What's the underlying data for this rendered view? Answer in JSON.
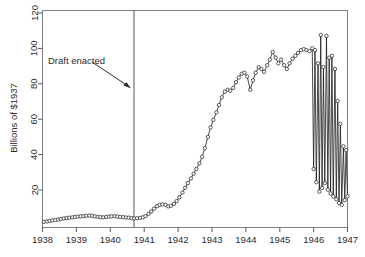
{
  "figure": {
    "background_color": "#ffffff",
    "frame_color": "#808080",
    "series_color": "#1a1a1a"
  },
  "axes": {
    "ylabel": "Billions of $1937",
    "y_ticks": [
      "20",
      "40",
      "60",
      "80",
      "100",
      "120"
    ],
    "x_ticks": [
      "1938",
      "1939",
      "1940",
      "1941",
      "1942",
      "1943",
      "1944",
      "1945",
      "1946",
      "1947"
    ]
  },
  "annotation": {
    "label": "Draft enacted",
    "event_year": 1940.7
  },
  "chart_data": {
    "type": "line",
    "title": "",
    "subtitle": "",
    "xlabel": "",
    "ylabel": "Billions of $1937",
    "xlim": [
      1938.0,
      1947.0
    ],
    "ylim": [
      10.0,
      125.0
    ],
    "grid": false,
    "legend": null,
    "marker": "open-circle",
    "x_tick_values": [
      1938,
      1939,
      1940,
      1941,
      1942,
      1943,
      1944,
      1945,
      1946,
      1947
    ],
    "y_tick_values": [
      20,
      40,
      60,
      80,
      100,
      120
    ],
    "annotations": [
      {
        "text": "Draft enacted",
        "x": 1940.7,
        "type": "vertical-line-with-arrow"
      }
    ],
    "series": [
      {
        "name": "Real military spending",
        "x": [
          1938.04,
          1938.13,
          1938.21,
          1938.29,
          1938.38,
          1938.46,
          1938.54,
          1938.63,
          1938.71,
          1938.79,
          1938.88,
          1938.96,
          1939.04,
          1939.13,
          1939.21,
          1939.29,
          1939.38,
          1939.46,
          1939.54,
          1939.63,
          1939.71,
          1939.79,
          1939.88,
          1939.96,
          1940.04,
          1940.13,
          1940.21,
          1940.29,
          1940.38,
          1940.46,
          1940.54,
          1940.63,
          1940.71,
          1940.79,
          1940.88,
          1940.96,
          1941.04,
          1941.13,
          1941.21,
          1941.29,
          1941.38,
          1941.46,
          1941.54,
          1941.63,
          1941.71,
          1941.79,
          1941.88,
          1941.96,
          1942.04,
          1942.13,
          1942.21,
          1942.29,
          1942.38,
          1942.46,
          1942.54,
          1942.63,
          1942.71,
          1942.79,
          1942.88,
          1942.96,
          1943.04,
          1943.13,
          1943.21,
          1943.29,
          1943.38,
          1943.46,
          1943.54,
          1943.63,
          1943.71,
          1943.79,
          1943.88,
          1943.96,
          1944.04,
          1944.13,
          1944.21,
          1944.29,
          1944.38,
          1944.46,
          1944.54,
          1944.63,
          1944.71,
          1944.79,
          1944.88,
          1944.96,
          1945.04,
          1945.13,
          1945.21,
          1945.29,
          1945.38,
          1945.46,
          1945.54,
          1945.63,
          1945.71,
          1945.79,
          1945.88,
          1945.96,
          1946.04,
          1946.13,
          1946.21,
          1946.29,
          1946.38,
          1946.46,
          1946.54,
          1946.63,
          1946.71,
          1946.79,
          1946.88,
          1946.96
        ],
        "values": [
          13.0,
          13.2,
          13.5,
          13.8,
          14.0,
          14.2,
          14.5,
          14.8,
          15.0,
          15.2,
          15.4,
          15.6,
          15.8,
          15.9,
          16.0,
          16.2,
          16.3,
          16.2,
          15.9,
          15.7,
          15.5,
          15.4,
          15.6,
          15.8,
          15.9,
          16.0,
          15.8,
          15.6,
          15.5,
          15.3,
          15.2,
          15.0,
          14.8,
          14.9,
          15.1,
          15.4,
          16.0,
          17.2,
          18.5,
          20.0,
          21.3,
          22.0,
          22.3,
          22.0,
          21.2,
          21.5,
          22.5,
          24.0,
          26.0,
          28.5,
          31.0,
          33.5,
          36.0,
          38.5,
          41.0,
          44.0,
          47.5,
          52.0,
          58.0,
          63.0,
          67.0,
          71.0,
          75.0,
          79.0,
          82.0,
          83.0,
          82.5,
          84.0,
          87.0,
          89.5,
          91.5,
          92.0,
          90.0,
          83.0,
          88.0,
          92.0,
          95.0,
          94.0,
          92.5,
          96.0,
          99.0,
          103.0,
          100.0,
          97.0,
          99.0,
          96.0,
          94.0,
          97.0,
          99.5,
          101.0,
          102.5,
          104.0,
          104.5,
          104.0,
          103.5,
          105.0,
          104.0,
          97.0,
          112.0,
          95.0,
          111.5,
          100.0,
          101.0,
          94.0,
          77.0,
          65.0,
          53.0,
          51.0
        ]
      },
      {
        "name": "Real military spending (continued)",
        "x": [
          1946.0,
          1946.08,
          1946.17,
          1946.25,
          1946.33,
          1946.42,
          1946.5,
          1946.58,
          1946.67,
          1946.75,
          1946.83,
          1946.92,
          1947.0
        ],
        "values": [
          41.0,
          34.0,
          29.0,
          31.0,
          33.5,
          30.0,
          28.0,
          26.5,
          25.0,
          23.0,
          22.0,
          24.5,
          26.5
        ]
      }
    ]
  }
}
